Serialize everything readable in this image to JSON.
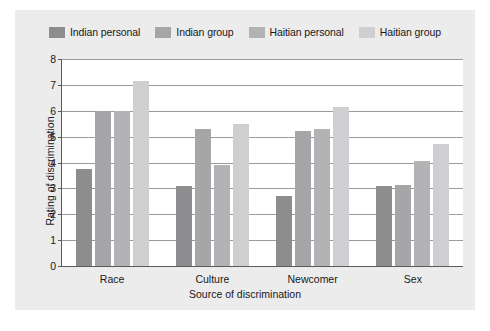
{
  "chart_data": {
    "type": "bar",
    "title": "",
    "xlabel": "Source of discrimination",
    "ylabel": "Rating of discrimination",
    "categories": [
      "Race",
      "Culture",
      "Newcomer",
      "Sex"
    ],
    "series": [
      {
        "name": "Indian personal",
        "color": "#8d8d8f",
        "values": [
          3.75,
          3.08,
          2.7,
          3.1
        ]
      },
      {
        "name": "Indian group",
        "color": "#a6a6a8",
        "values": [
          5.98,
          5.3,
          5.2,
          3.15
        ]
      },
      {
        "name": "Haitian personal",
        "color": "#b3b3b5",
        "values": [
          5.98,
          3.9,
          5.3,
          4.05
        ]
      },
      {
        "name": "Haitian group",
        "color": "#cfcfd1",
        "values": [
          7.15,
          5.5,
          6.15,
          4.7
        ]
      }
    ],
    "ylim": [
      0,
      8
    ],
    "yticks": [
      0,
      1,
      2,
      3,
      4,
      5,
      6,
      7,
      8
    ],
    "grid": "horizontal",
    "legend_position": "top"
  },
  "colors": {
    "figure_background": "#ececed",
    "plot_background": "#ffffff",
    "axis": "#5a5a5c",
    "gridline": "#9a9a9c",
    "text": "#18181a"
  }
}
